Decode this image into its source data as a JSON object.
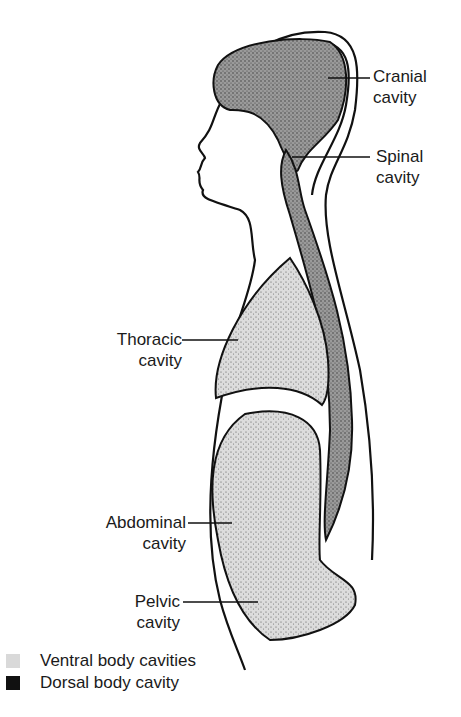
{
  "diagram": {
    "labels": {
      "cranial": {
        "line1": "Cranial",
        "line2": "cavity"
      },
      "spinal": {
        "line1": "Spinal",
        "line2": "cavity"
      },
      "thoracic": {
        "line1": "Thoracic",
        "line2": "cavity"
      },
      "abdominal": {
        "line1": "Abdominal",
        "line2": "cavity"
      },
      "pelvic": {
        "line1": "Pelvic",
        "line2": "cavity"
      }
    },
    "legend": [
      {
        "label": "Ventral body cavities",
        "color": "#d9d9d9"
      },
      {
        "label": "Dorsal body cavity",
        "color": "#111111"
      }
    ],
    "colors": {
      "dorsal_fill": "#8c8c8c",
      "ventral_fill": "#cfcfcf",
      "outline": "#111111"
    }
  }
}
